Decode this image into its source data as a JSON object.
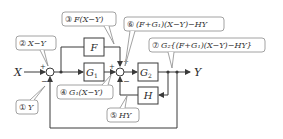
{
  "diagram": {
    "type": "block-diagram",
    "input": "X",
    "output": "Y",
    "blocks": {
      "F": "F",
      "G1": "G",
      "G1_sub": "1",
      "G2": "G",
      "G2_sub": "2",
      "H": "H"
    },
    "signs": {
      "sum1_in": "+",
      "sum1_fb": "−",
      "sum2_g1": "+",
      "sum2_f": "+",
      "sum2_h": "−"
    },
    "callouts": [
      {
        "id": "1",
        "marker": "①",
        "text": "Y"
      },
      {
        "id": "2",
        "marker": "②",
        "text": "X−Y"
      },
      {
        "id": "3",
        "marker": "③",
        "text": "F(X−Y)"
      },
      {
        "id": "4",
        "marker": "④",
        "text": "G₁(X−Y)"
      },
      {
        "id": "5",
        "marker": "⑤",
        "text": "HY"
      },
      {
        "id": "6",
        "marker": "⑥",
        "text": "(F+G₁)(X−Y)−HY"
      },
      {
        "id": "7",
        "marker": "⑦",
        "text": "G₂{(F+G₁)(X−Y)−HY}"
      }
    ],
    "colors": {
      "line": "#3a3a3a",
      "callout_border": "#8a8a8a",
      "text": "#2a2a2a"
    }
  }
}
